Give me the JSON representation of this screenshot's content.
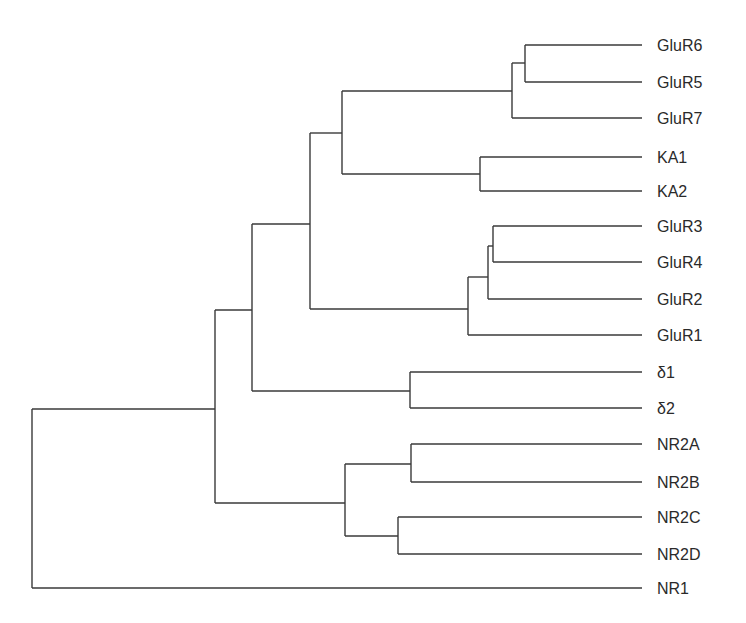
{
  "diagram": {
    "type": "dendrogram",
    "orientation": "left-to-right",
    "line_color": "#3a3a3a",
    "label_color": "#2a2a2a",
    "leaf_end_x": 642,
    "label_x": 657,
    "leaves": [
      {
        "id": "GluR6",
        "label": "GluR6",
        "y": 45
      },
      {
        "id": "GluR5",
        "label": "GluR5",
        "y": 82
      },
      {
        "id": "GluR7",
        "label": "GluR7",
        "y": 118
      },
      {
        "id": "KA1",
        "label": "KA1",
        "y": 157
      },
      {
        "id": "KA2",
        "label": "KA2",
        "y": 191
      },
      {
        "id": "GluR3",
        "label": "GluR3",
        "y": 226
      },
      {
        "id": "GluR4",
        "label": "GluR4",
        "y": 262
      },
      {
        "id": "GluR2",
        "label": "GluR2",
        "y": 299
      },
      {
        "id": "GluR1",
        "label": "GluR1",
        "y": 335
      },
      {
        "id": "delta1",
        "label": "δ1",
        "y": 372
      },
      {
        "id": "delta2",
        "label": "δ2",
        "y": 408
      },
      {
        "id": "NR2A",
        "label": "NR2A",
        "y": 444
      },
      {
        "id": "NR2B",
        "label": "NR2B",
        "y": 482
      },
      {
        "id": "NR2C",
        "label": "NR2C",
        "y": 517
      },
      {
        "id": "NR2D",
        "label": "NR2D",
        "y": 554
      },
      {
        "id": "NR1",
        "label": "NR1",
        "y": 588
      }
    ],
    "nodes": [
      {
        "id": "n_glur65",
        "x": 525,
        "children": [
          "GluR6",
          "GluR5"
        ],
        "y": 63
      },
      {
        "id": "n_glur567",
        "x": 512,
        "children": [
          "n_glur65",
          "GluR7"
        ],
        "y": 91
      },
      {
        "id": "n_ka",
        "x": 480,
        "children": [
          "KA1",
          "KA2"
        ],
        "y": 174
      },
      {
        "id": "n_kainate",
        "x": 342,
        "children": [
          "n_glur567",
          "n_ka"
        ],
        "y": 133
      },
      {
        "id": "n_glur34",
        "x": 493,
        "children": [
          "GluR3",
          "GluR4"
        ],
        "y": 246
      },
      {
        "id": "n_glur342",
        "x": 488,
        "children": [
          "n_glur34",
          "GluR2"
        ],
        "y": 277
      },
      {
        "id": "n_ampa",
        "x": 468,
        "children": [
          "n_glur342",
          "GluR1"
        ],
        "y": 309
      },
      {
        "id": "n_ka_ampa",
        "x": 310,
        "children": [
          "n_kainate",
          "n_ampa"
        ],
        "y": 224
      },
      {
        "id": "n_delta",
        "x": 410,
        "children": [
          "delta1",
          "delta2"
        ],
        "y": 391
      },
      {
        "id": "n_non_nmda",
        "x": 252,
        "children": [
          "n_ka_ampa",
          "n_delta"
        ],
        "y": 310
      },
      {
        "id": "n_nr2ab",
        "x": 411,
        "children": [
          "NR2A",
          "NR2B"
        ],
        "y": 464
      },
      {
        "id": "n_nr2cd",
        "x": 398,
        "children": [
          "NR2C",
          "NR2D"
        ],
        "y": 536
      },
      {
        "id": "n_nr2",
        "x": 345,
        "children": [
          "n_nr2ab",
          "n_nr2cd"
        ],
        "y": 503
      },
      {
        "id": "n_ionotropic",
        "x": 215,
        "children": [
          "n_non_nmda",
          "n_nr2"
        ],
        "y": 409
      },
      {
        "id": "n_root",
        "x": 32,
        "children": [
          "n_ionotropic",
          "NR1"
        ],
        "y": null
      }
    ]
  }
}
